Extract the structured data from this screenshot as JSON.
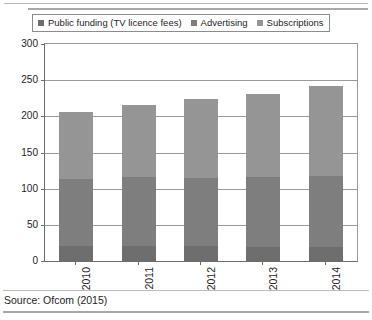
{
  "chart_data": {
    "type": "bar",
    "barmode": "stacked",
    "title": "",
    "subtitle": "",
    "xlabel": "",
    "ylabel": "",
    "categories": [
      "2010",
      "2011",
      "2012",
      "2013",
      "2014"
    ],
    "series": [
      {
        "name": "Public funding (TV licence fees)",
        "color": "#6e6e6e",
        "values": [
          21,
          21,
          21,
          20,
          20
        ]
      },
      {
        "name": "Advertising",
        "color": "#7e7e7e",
        "values": [
          93,
          95,
          94,
          96,
          98
        ]
      },
      {
        "name": "Subscriptions",
        "color": "#959595",
        "values": [
          92,
          99,
          109,
          115,
          124
        ]
      }
    ],
    "totals": [
      206,
      215,
      224,
      231,
      242
    ],
    "ylim": [
      0,
      300
    ],
    "yticks": [
      0,
      50,
      100,
      150,
      200,
      250,
      300
    ],
    "ytick_labels": [
      "0",
      "50",
      "100",
      "150",
      "200",
      "250",
      "300"
    ],
    "grid": true,
    "grid_axis": "y",
    "legend_position": "top-left",
    "legend": [
      {
        "label": "Public funding (TV licence fees)",
        "color": "#6e6e6e"
      },
      {
        "label": "Advertising",
        "color": "#7e7e7e"
      },
      {
        "label": "Subscriptions",
        "color": "#959595"
      }
    ]
  },
  "footer": {
    "source": "Source: Ofcom (2015)"
  }
}
